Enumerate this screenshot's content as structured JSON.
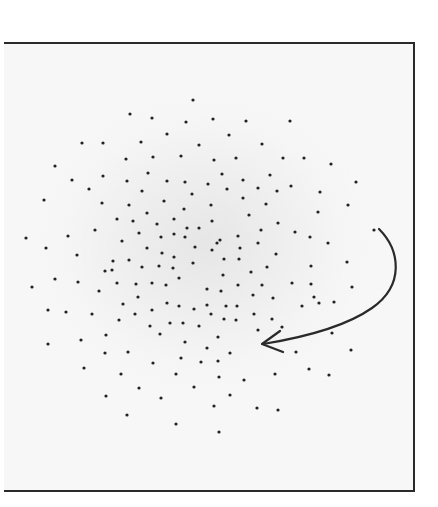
{
  "figure": {
    "colors": {
      "background": "#ffffff",
      "frame_fill": "#f2f2f2",
      "frame_border": "#2a2a2a",
      "dot": "#222222",
      "arrow": "#2a2a2a"
    },
    "dot_radius": 1.6,
    "dots": [
      [
        193,
        100
      ],
      [
        130,
        114
      ],
      [
        152,
        118
      ],
      [
        186,
        122
      ],
      [
        213,
        119
      ],
      [
        246,
        121
      ],
      [
        290,
        121
      ],
      [
        167,
        134
      ],
      [
        229,
        135
      ],
      [
        82,
        143
      ],
      [
        103,
        143
      ],
      [
        141,
        142
      ],
      [
        199,
        145
      ],
      [
        262,
        144
      ],
      [
        126,
        159
      ],
      [
        153,
        157
      ],
      [
        181,
        156
      ],
      [
        214,
        160
      ],
      [
        236,
        158
      ],
      [
        283,
        158
      ],
      [
        304,
        158
      ],
      [
        331,
        164
      ],
      [
        55,
        166
      ],
      [
        72,
        180
      ],
      [
        103,
        176
      ],
      [
        127,
        181
      ],
      [
        148,
        173
      ],
      [
        167,
        181
      ],
      [
        185,
        182
      ],
      [
        222,
        174
      ],
      [
        243,
        180
      ],
      [
        270,
        175
      ],
      [
        356,
        182
      ],
      [
        89,
        189
      ],
      [
        142,
        191
      ],
      [
        208,
        184
      ],
      [
        192,
        194
      ],
      [
        227,
        189
      ],
      [
        258,
        188
      ],
      [
        277,
        191
      ],
      [
        291,
        186
      ],
      [
        320,
        192
      ],
      [
        243,
        198
      ],
      [
        44,
        200
      ],
      [
        102,
        203
      ],
      [
        129,
        205
      ],
      [
        147,
        213
      ],
      [
        164,
        201
      ],
      [
        184,
        209
      ],
      [
        211,
        205
      ],
      [
        266,
        204
      ],
      [
        249,
        215
      ],
      [
        318,
        212
      ],
      [
        348,
        205
      ],
      [
        117,
        219
      ],
      [
        133,
        221
      ],
      [
        157,
        224
      ],
      [
        174,
        219
      ],
      [
        187,
        228
      ],
      [
        199,
        228
      ],
      [
        212,
        221
      ],
      [
        278,
        223
      ],
      [
        261,
        230
      ],
      [
        374,
        230
      ],
      [
        68,
        236
      ],
      [
        95,
        230
      ],
      [
        139,
        233
      ],
      [
        174,
        234
      ],
      [
        26,
        238
      ],
      [
        161,
        237
      ],
      [
        185,
        237
      ],
      [
        238,
        236
      ],
      [
        295,
        232
      ],
      [
        310,
        237
      ],
      [
        122,
        241
      ],
      [
        46,
        248
      ],
      [
        147,
        248
      ],
      [
        195,
        247
      ],
      [
        217,
        243
      ],
      [
        240,
        248
      ],
      [
        258,
        243
      ],
      [
        328,
        243
      ],
      [
        220,
        240
      ],
      [
        77,
        255
      ],
      [
        113,
        261
      ],
      [
        129,
        260
      ],
      [
        162,
        253
      ],
      [
        174,
        257
      ],
      [
        212,
        250
      ],
      [
        276,
        254
      ],
      [
        239,
        259
      ],
      [
        224,
        259
      ],
      [
        347,
        262
      ],
      [
        112,
        270
      ],
      [
        142,
        267
      ],
      [
        159,
        266
      ],
      [
        193,
        263
      ],
      [
        173,
        268
      ],
      [
        251,
        272
      ],
      [
        267,
        267
      ],
      [
        311,
        266
      ],
      [
        55,
        279
      ],
      [
        78,
        282
      ],
      [
        105,
        271
      ],
      [
        117,
        283
      ],
      [
        136,
        284
      ],
      [
        152,
        283
      ],
      [
        166,
        285
      ],
      [
        179,
        278
      ],
      [
        223,
        275
      ],
      [
        32,
        287
      ],
      [
        99,
        291
      ],
      [
        207,
        289
      ],
      [
        238,
        285
      ],
      [
        262,
        285
      ],
      [
        292,
        283
      ],
      [
        311,
        284
      ],
      [
        352,
        287
      ],
      [
        138,
        297
      ],
      [
        221,
        291
      ],
      [
        253,
        295
      ],
      [
        273,
        298
      ],
      [
        314,
        297
      ],
      [
        48,
        310
      ],
      [
        66,
        312
      ],
      [
        92,
        314
      ],
      [
        123,
        304
      ],
      [
        152,
        310
      ],
      [
        167,
        303
      ],
      [
        179,
        306
      ],
      [
        194,
        309
      ],
      [
        207,
        305
      ],
      [
        226,
        306
      ],
      [
        237,
        306
      ],
      [
        334,
        302
      ],
      [
        302,
        306
      ],
      [
        319,
        303
      ],
      [
        119,
        320
      ],
      [
        135,
        314
      ],
      [
        211,
        314
      ],
      [
        224,
        319
      ],
      [
        236,
        320
      ],
      [
        254,
        314
      ],
      [
        272,
        319
      ],
      [
        150,
        326
      ],
      [
        170,
        323
      ],
      [
        183,
        323
      ],
      [
        199,
        326
      ],
      [
        258,
        330
      ],
      [
        282,
        327
      ],
      [
        106,
        335
      ],
      [
        160,
        334
      ],
      [
        81,
        340
      ],
      [
        48,
        344
      ],
      [
        185,
        342
      ],
      [
        218,
        337
      ],
      [
        332,
        333
      ],
      [
        128,
        352
      ],
      [
        105,
        353
      ],
      [
        207,
        348
      ],
      [
        230,
        353
      ],
      [
        296,
        352
      ],
      [
        351,
        350
      ],
      [
        153,
        363
      ],
      [
        181,
        358
      ],
      [
        201,
        362
      ],
      [
        218,
        361
      ],
      [
        309,
        369
      ],
      [
        84,
        368
      ],
      [
        121,
        374
      ],
      [
        176,
        374
      ],
      [
        219,
        377
      ],
      [
        244,
        380
      ],
      [
        275,
        374
      ],
      [
        329,
        375
      ],
      [
        139,
        388
      ],
      [
        106,
        396
      ],
      [
        161,
        398
      ],
      [
        194,
        387
      ],
      [
        230,
        395
      ],
      [
        127,
        415
      ],
      [
        214,
        406
      ],
      [
        257,
        408
      ],
      [
        278,
        410
      ],
      [
        176,
        424
      ],
      [
        219,
        432
      ]
    ],
    "arrow": {
      "path": "M379,229 C400,250 405,285 372,308 C345,327 300,338 263,344",
      "head_tip": [
        262,
        344
      ],
      "head_barbs": [
        [
          280,
          331
        ],
        [
          283,
          352
        ]
      ],
      "stroke_width": 2.2
    }
  }
}
